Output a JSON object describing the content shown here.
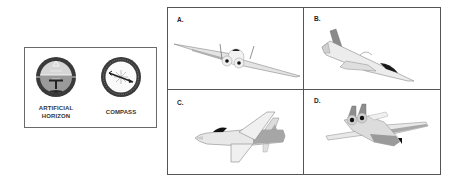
{
  "instruments": {
    "artificial_horizon": {
      "label_line1": "ARTIFICIAL",
      "label_line2": "HORIZON",
      "icon": "artificial-horizon-icon"
    },
    "compass": {
      "label": "COMPASS",
      "icon": "compass-icon"
    }
  },
  "options": [
    {
      "label": "A.",
      "icon": "airplane-banked-head-on-icon"
    },
    {
      "label": "B.",
      "icon": "airplane-diving-left-icon"
    },
    {
      "label": "C.",
      "icon": "airplane-level-side-icon"
    },
    {
      "label": "D.",
      "icon": "airplane-banked-rear-icon"
    }
  ],
  "colors": {
    "border": "#555555",
    "dial_ring": "#333333",
    "sky": "#c8c8c8",
    "ground": "#8a8a8a",
    "plane_light": "#e6e6e6",
    "plane_mid": "#a8a8a8",
    "plane_dark": "#2a2a2a"
  }
}
